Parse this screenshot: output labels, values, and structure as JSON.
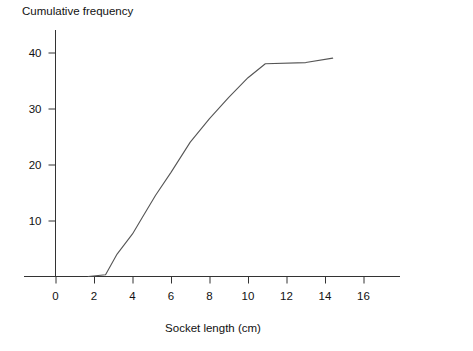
{
  "chart_data": {
    "type": "line",
    "title": "Cumulative frequency",
    "xlabel": "Socket length  (cm)",
    "ylabel": "Cumulative frequency",
    "xlim": [
      0,
      17.5
    ],
    "ylim": [
      0,
      44
    ],
    "grid": false,
    "legend": null,
    "xticks": [
      0,
      2,
      4,
      6,
      8,
      10,
      12,
      14,
      16
    ],
    "xtick_labels": [
      "0",
      "2",
      "4",
      "6",
      "8",
      "10",
      "12",
      "14",
      "16"
    ],
    "yticks": [
      10,
      20,
      30,
      40
    ],
    "ytick_labels": [
      "10",
      "20",
      "30",
      "40"
    ],
    "series": [
      {
        "name": "Cumulative frequency",
        "color": "#555555",
        "x": [
          1.7,
          2.6,
          3.2,
          4.0,
          4.5,
          5.2,
          6.0,
          7.0,
          8.0,
          9.0,
          10.0,
          10.9,
          13.0,
          14.4
        ],
        "values": [
          0,
          0.3,
          4.0,
          7.6,
          10.5,
          14.5,
          18.6,
          24.0,
          28.2,
          32.0,
          35.5,
          38.0,
          38.2,
          39.0
        ]
      }
    ]
  },
  "axes": {
    "title_text": "Cumulative frequency",
    "x_axis_label": "Socket length  (cm)"
  }
}
